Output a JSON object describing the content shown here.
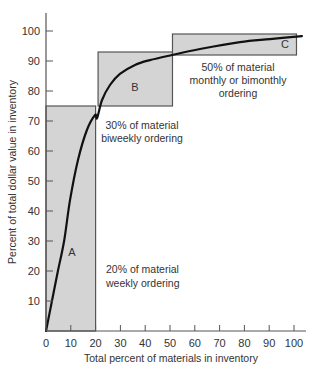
{
  "chart_data": {
    "type": "line",
    "title": "",
    "xlabel": "Total percent of materials in inventory",
    "ylabel": "Percent of total dollar value in inventory",
    "xlim": [
      0,
      105
    ],
    "ylim": [
      0,
      105
    ],
    "grid": false,
    "x_ticks": [
      0,
      10,
      20,
      30,
      40,
      50,
      60,
      70,
      80,
      90,
      100
    ],
    "y_ticks": [
      10,
      20,
      30,
      40,
      50,
      60,
      70,
      80,
      90,
      100
    ],
    "series": [
      {
        "name": "Cumulative dollar value curve",
        "x": [
          0,
          2.4,
          4.8,
          7.3,
          9.7,
          12.9,
          16.5,
          19.8,
          20.6,
          22.6,
          25.8,
          29.8,
          35.9,
          41.9,
          50.8,
          62.1,
          78.2,
          90.3,
          103.2
        ],
        "y": [
          0,
          10,
          20,
          30,
          43.7,
          57,
          67,
          72,
          71,
          77,
          82,
          85.7,
          88.7,
          90.3,
          92,
          94,
          96.3,
          97.3,
          98.3
        ]
      }
    ],
    "regions": [
      {
        "label": "A",
        "x_range": [
          0,
          20
        ],
        "y_range": [
          0,
          75
        ],
        "annotation": [
          "20% of material",
          "weekly ordering"
        ]
      },
      {
        "label": "B",
        "x_range": [
          21,
          51
        ],
        "y_range": [
          75,
          93
        ],
        "annotation": [
          "30% of material",
          "biweekly ordering"
        ]
      },
      {
        "label": "C",
        "x_range": [
          51,
          101
        ],
        "y_range": [
          92,
          99
        ],
        "annotation": [
          "50% of material",
          "monthly or bimonthly",
          "ordering"
        ]
      }
    ]
  },
  "colors": {
    "region_fill": "#d4d4d4",
    "region_stroke": "#555555",
    "curve": "#111111",
    "axis": "#555555",
    "text": "#333333"
  }
}
